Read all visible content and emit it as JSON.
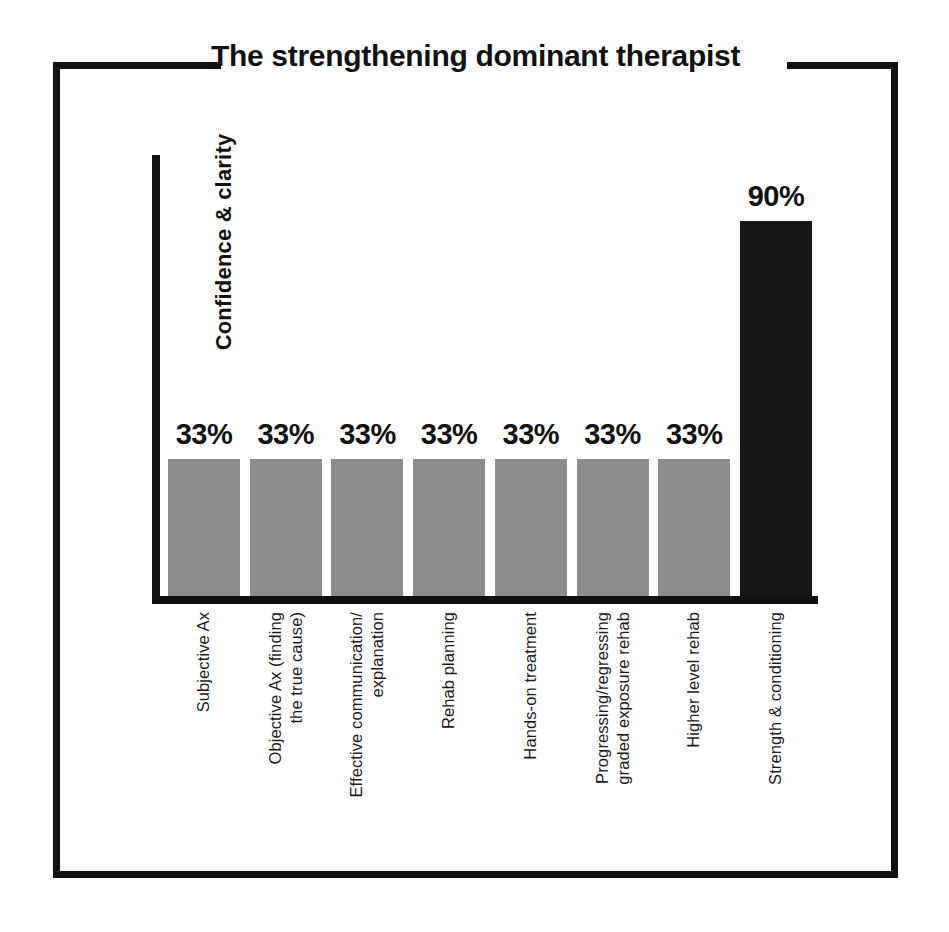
{
  "chart_data": {
    "type": "bar",
    "title": "The strengthening dominant therapist",
    "xlabel": "",
    "ylabel": "Confidence & clarity",
    "categories": [
      "Subjective Ax",
      "Objective Ax (finding the true cause)",
      "Effective communication/ explanation",
      "Rehab planning",
      "Hands-on treatment",
      "Progressing/regressing graded exposure rehab",
      "Higher level rehab",
      "Strength & conditioning"
    ],
    "values": [
      33,
      33,
      33,
      33,
      33,
      33,
      33,
      90
    ],
    "value_labels": [
      "33%",
      "33%",
      "33%",
      "33%",
      "33%",
      "33%",
      "33%",
      "90%"
    ],
    "ylim": [
      0,
      100
    ],
    "grid": false,
    "legend": null,
    "colors": {
      "bar_default": "#8c8c8c",
      "bar_highlight": "#161616",
      "axis": "#111111",
      "text": "#111111",
      "background": "#ffffff"
    },
    "highlight_index": 7
  },
  "frame": {
    "title": "The strengthening dominant therapist"
  },
  "axis": {
    "y_title": "Confidence & clarity"
  },
  "x_tick_labels": [
    {
      "line1": "Subjective Ax",
      "line2": ""
    },
    {
      "line1": "Objective Ax (finding",
      "line2": "the true cause)"
    },
    {
      "line1": "Effective communication/",
      "line2": "explanation"
    },
    {
      "line1": "Rehab planning",
      "line2": ""
    },
    {
      "line1": "Hands-on treatment",
      "line2": ""
    },
    {
      "line1": "Progressing/regressing",
      "line2": "graded exposure rehab"
    },
    {
      "line1": "Higher level rehab",
      "line2": ""
    },
    {
      "line1": "Strength & conditioning",
      "line2": ""
    }
  ],
  "bar_labels": [
    "33%",
    "33%",
    "33%",
    "33%",
    "33%",
    "33%",
    "33%",
    "90%"
  ]
}
